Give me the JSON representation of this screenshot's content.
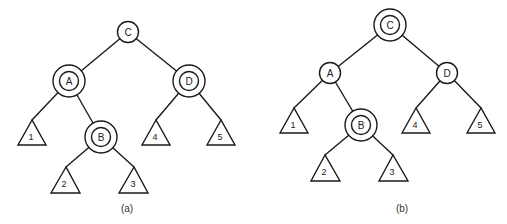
{
  "figures": [
    {
      "caption": "(a)",
      "nodes": [
        {
          "id": "C",
          "label": "C",
          "marked": false
        },
        {
          "id": "A",
          "label": "A",
          "marked": true
        },
        {
          "id": "D",
          "label": "D",
          "marked": true
        },
        {
          "id": "B",
          "label": "B",
          "marked": true
        }
      ],
      "subtrees": [
        {
          "label": "1"
        },
        {
          "label": "2"
        },
        {
          "label": "3"
        },
        {
          "label": "4"
        },
        {
          "label": "5"
        }
      ],
      "edges": [
        [
          "C",
          "A"
        ],
        [
          "C",
          "D"
        ],
        [
          "A",
          "1"
        ],
        [
          "A",
          "B"
        ],
        [
          "B",
          "2"
        ],
        [
          "B",
          "3"
        ],
        [
          "D",
          "4"
        ],
        [
          "D",
          "5"
        ]
      ]
    },
    {
      "caption": "(b)",
      "nodes": [
        {
          "id": "C",
          "label": "C",
          "marked": true
        },
        {
          "id": "A",
          "label": "A",
          "marked": false
        },
        {
          "id": "D",
          "label": "D",
          "marked": false
        },
        {
          "id": "B",
          "label": "B",
          "marked": true
        }
      ],
      "subtrees": [
        {
          "label": "1"
        },
        {
          "label": "2"
        },
        {
          "label": "3"
        },
        {
          "label": "4"
        },
        {
          "label": "5"
        }
      ],
      "edges": [
        [
          "C",
          "A"
        ],
        [
          "C",
          "D"
        ],
        [
          "A",
          "1"
        ],
        [
          "A",
          "B"
        ],
        [
          "B",
          "2"
        ],
        [
          "B",
          "3"
        ],
        [
          "D",
          "4"
        ],
        [
          "D",
          "5"
        ]
      ]
    }
  ]
}
